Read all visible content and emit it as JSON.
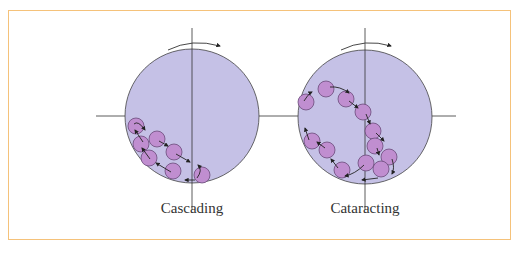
{
  "colors": {
    "accent": "#f7a640",
    "border": "#f5c27a",
    "drum_fill": "#c5c1e6",
    "ball_fill": "#c08ed0",
    "line": "#333333"
  },
  "diagrams": [
    {
      "id": "cascading",
      "label": "Cascading",
      "center": [
        192,
        116
      ],
      "radius": 67,
      "rotation": "clockwise",
      "balls": [
        [
          136,
          126
        ],
        [
          157,
          139
        ],
        [
          141,
          144
        ],
        [
          164,
          157
        ],
        [
          177,
          153
        ],
        [
          174,
          170
        ],
        [
          202,
          176
        ]
      ]
    },
    {
      "id": "cataracting",
      "label": "Cataracting",
      "center": [
        365,
        117
      ],
      "radius": 67,
      "rotation": "clockwise",
      "balls": [
        [
          305,
          102
        ],
        [
          326,
          89
        ],
        [
          346,
          99
        ],
        [
          364,
          112
        ],
        [
          373,
          130
        ],
        [
          376,
          145
        ],
        [
          389,
          157
        ],
        [
          382,
          168
        ],
        [
          367,
          162
        ],
        [
          342,
          169
        ],
        [
          326,
          150
        ],
        [
          312,
          140
        ]
      ]
    }
  ]
}
